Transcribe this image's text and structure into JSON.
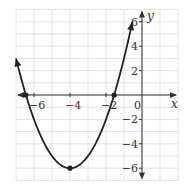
{
  "chart_data": {
    "type": "line",
    "title": "",
    "xlabel": "x",
    "ylabel": "y",
    "xlim": [
      -7,
      2
    ],
    "ylim": [
      -7,
      7
    ],
    "grid": true,
    "x_ticks": [
      -6,
      -4,
      -2,
      0
    ],
    "x_tick_labels": [
      "−6",
      "−4",
      "−2",
      "0"
    ],
    "y_ticks": [
      6,
      4,
      2,
      -2,
      -4,
      -6
    ],
    "y_tick_labels": [
      "6",
      "4",
      "2",
      "−2",
      "−4",
      "−6"
    ],
    "series": [
      {
        "name": "parabola",
        "equation": "y = (x + 4)^2 - 6",
        "x_range": [
          -7,
          -0.54
        ],
        "color": "#222222"
      }
    ],
    "points": [
      {
        "label": "vertex",
        "x": -4,
        "y": -6
      },
      {
        "label": "x-intercept-left",
        "x": -6.45,
        "y": 0
      },
      {
        "label": "x-intercept-right",
        "x": -1.55,
        "y": 0
      }
    ]
  },
  "colors": {
    "grid": "#dcdcdc",
    "axis": "#333333",
    "curve": "#222222",
    "text": "#333333"
  }
}
